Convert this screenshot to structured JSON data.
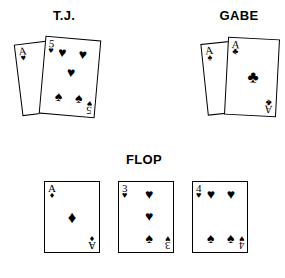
{
  "headings": {
    "player_left": "T.J.",
    "player_right": "GABE",
    "board": "FLOP"
  },
  "suit_glyphs": {
    "hearts": "♥",
    "spades": "♠",
    "diamonds": "♦",
    "clubs": "♣"
  },
  "colors": {
    "ink": "#000000",
    "background": "#ffffff",
    "card_face": "#ffffff",
    "card_border": "#000000"
  },
  "hands": {
    "tj": {
      "label": "T.J.",
      "back_card": {
        "rank": "A",
        "suit": "♥",
        "suit_name": "hearts"
      },
      "front_card": {
        "rank": "5",
        "suit": "♥",
        "suit_name": "hearts",
        "pips": [
          "♥",
          "♥",
          "♥",
          "♠",
          "♠"
        ]
      }
    },
    "gabe": {
      "label": "GABE",
      "back_card": {
        "rank": "A",
        "suit": "♠",
        "suit_name": "spades"
      },
      "front_card": {
        "rank": "A",
        "suit": "♣",
        "suit_name": "clubs",
        "pips": [
          "♣"
        ]
      }
    }
  },
  "flop": {
    "label": "FLOP",
    "cards": [
      {
        "rank": "A",
        "suit": "♦",
        "suit_name": "diamonds",
        "pips": [
          "♦"
        ]
      },
      {
        "rank": "3",
        "suit": "♥",
        "suit_name": "hearts",
        "pips": [
          "♥",
          "♥",
          "♠"
        ]
      },
      {
        "rank": "4",
        "suit": "♥",
        "suit_name": "hearts",
        "pips": [
          "♥",
          "♥",
          "♠",
          "♠"
        ]
      }
    ]
  }
}
